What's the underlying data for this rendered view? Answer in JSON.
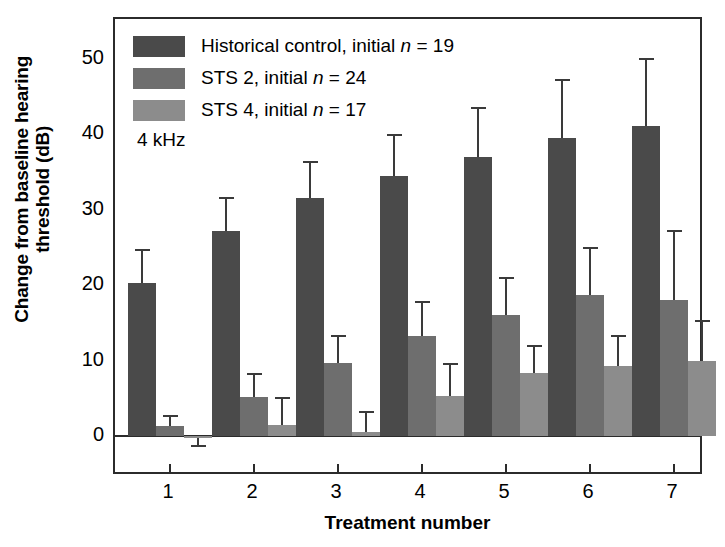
{
  "chart_data": {
    "type": "bar",
    "title": "",
    "annotation": "4 kHz",
    "xlabel": "Treatment number",
    "ylabel": "Change from baseline hearing threshold (dB)",
    "ylabel_line1": "Change from baseline hearing",
    "ylabel_line2": "threshold (dB)",
    "categories": [
      "1",
      "2",
      "3",
      "4",
      "5",
      "6",
      "7"
    ],
    "xtick_labels": [
      "1",
      "2",
      "3",
      "4",
      "5",
      "6",
      "7"
    ],
    "ytick_labels": [
      "0",
      "10",
      "20",
      "30",
      "40",
      "50"
    ],
    "ytick_values": [
      0,
      10,
      20,
      30,
      40,
      50
    ],
    "yminor_values": [
      5,
      15,
      25,
      35,
      45
    ],
    "ylim": [
      -5.0,
      53.0
    ],
    "grid": false,
    "legend_position": "upper-left",
    "errorbar_type": "standard deviation",
    "series": [
      {
        "name": "Historical control, initial n = 19",
        "label_prefix": "Historical control, initial ",
        "label_italic": "n",
        "label_suffix": " = 19",
        "color": "#4a4a4a",
        "values": [
          20.3,
          27.2,
          31.5,
          34.5,
          37.0,
          39.5,
          41.1
        ],
        "errors_upper": [
          24.7,
          31.6,
          36.3,
          39.9,
          43.5,
          47.2,
          50.0
        ]
      },
      {
        "name": "STS 2, initial n = 24",
        "label_prefix": "STS 2, initial ",
        "label_italic": "n",
        "label_suffix": " = 24",
        "color": "#6e6e6e",
        "values": [
          1.3,
          5.2,
          9.7,
          13.2,
          16.0,
          18.7,
          18.0
        ],
        "errors_upper": [
          2.6,
          8.2,
          13.2,
          17.8,
          20.9,
          25.0,
          27.2
        ]
      },
      {
        "name": "STS 4, initial n = 17",
        "label_prefix": "STS 4, initial ",
        "label_italic": "n",
        "label_suffix": " = 17",
        "color": "#8c8c8c",
        "values": [
          -0.3,
          1.5,
          0.5,
          5.3,
          8.4,
          9.3,
          10.0
        ],
        "errors_upper": [
          -1.3,
          5.1,
          3.2,
          9.6,
          12.0,
          13.3,
          15.3
        ]
      }
    ]
  },
  "colors": {
    "axis": "#2b2b2b",
    "background": "#ffffff",
    "series_1": "#4a4a4a",
    "series_2": "#6e6e6e",
    "series_3": "#8c8c8c"
  }
}
